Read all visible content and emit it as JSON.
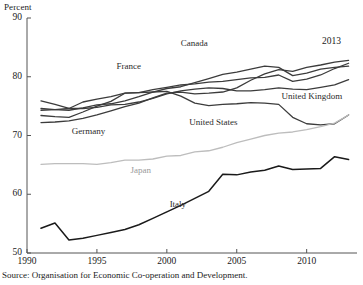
{
  "chart_data": {
    "type": "line",
    "title": "",
    "ylabel": "Percent",
    "xlabel": "",
    "ylim": [
      50,
      90
    ],
    "xlim": [
      1990,
      2013.6
    ],
    "yticks": [
      50,
      60,
      70,
      80,
      90
    ],
    "xticks": [
      1990,
      1995,
      2000,
      2005,
      2010
    ],
    "grid": false,
    "legend_position": "inline-labels",
    "annotations": [
      {
        "text": "2013",
        "x": 2012.2,
        "y": 87.2
      }
    ],
    "x": [
      1991,
      1992,
      1993,
      1994,
      1995,
      1996,
      1997,
      1998,
      1999,
      2000,
      2001,
      2002,
      2003,
      2004,
      2005,
      2006,
      2007,
      2008,
      2009,
      2010,
      2011,
      2012,
      2013
    ],
    "series": [
      {
        "name": "Canada",
        "color": "#3c3c3c",
        "label_x": 2001.0,
        "label_y": 85.6,
        "values": [
          74.6,
          74.4,
          74.3,
          74.7,
          75.2,
          75.4,
          75.9,
          76.6,
          77.4,
          78.0,
          78.3,
          79.0,
          79.7,
          80.4,
          80.8,
          81.3,
          81.8,
          81.6,
          80.2,
          80.6,
          81.3,
          81.6,
          81.8
        ]
      },
      {
        "name": "France",
        "color": "#3c3c3c",
        "label_x": 1996.4,
        "label_y": 81.7,
        "values": [
          75.9,
          75.3,
          74.6,
          74.6,
          74.8,
          75.2,
          75.3,
          75.7,
          76.3,
          77.1,
          77.6,
          77.9,
          78.1,
          78.0,
          77.6,
          77.6,
          77.8,
          78.1,
          77.9,
          77.8,
          78.2,
          78.6,
          79.5
        ]
      },
      {
        "name": "Germany",
        "color": "#3c3c3c",
        "label_x": 1993.2,
        "label_y": 70.6,
        "values": [
          72.2,
          72.3,
          72.5,
          72.9,
          73.5,
          74.2,
          74.9,
          75.5,
          76.4,
          77.2,
          77.4,
          77.1,
          77.2,
          77.4,
          78.1,
          79.4,
          80.5,
          81.2,
          80.9,
          81.6,
          82.0,
          82.5,
          82.8
        ]
      },
      {
        "name": "United Kingdom",
        "color": "#3c3c3c",
        "label_x": 2008.2,
        "label_y": 76.6,
        "values": [
          73.4,
          73.2,
          73.1,
          74.0,
          75.0,
          75.8,
          77.2,
          77.3,
          77.8,
          78.2,
          78.6,
          78.8,
          79.1,
          79.2,
          79.5,
          79.8,
          79.9,
          80.3,
          79.2,
          79.6,
          80.3,
          81.4,
          82.3
        ]
      },
      {
        "name": "United States",
        "color": "#3c3c3c",
        "label_x": 2001.6,
        "label_y": 72.1,
        "values": [
          74.3,
          74.4,
          74.6,
          75.7,
          76.2,
          76.6,
          77.2,
          77.3,
          77.4,
          77.5,
          76.7,
          75.5,
          75.1,
          75.3,
          75.4,
          75.6,
          75.5,
          75.3,
          73.1,
          72.0,
          71.8,
          72.0,
          73.5
        ]
      },
      {
        "name": "Japan",
        "color": "#bdbdbd",
        "label_x": 1997.4,
        "label_y": 63.9,
        "values": [
          65.1,
          65.2,
          65.2,
          65.2,
          65.1,
          65.4,
          65.8,
          65.8,
          66.0,
          66.5,
          66.6,
          67.2,
          67.4,
          68.0,
          68.8,
          69.4,
          70.0,
          70.4,
          70.6,
          71.0,
          71.5,
          72.1,
          73.5
        ]
      },
      {
        "name": "Italy",
        "color": "#1a1a1a",
        "label_x": 2000.2,
        "label_y": 58.1,
        "values": [
          54.2,
          55.1,
          52.2,
          52.5,
          53.0,
          53.5,
          54.0,
          54.8,
          55.9,
          57.0,
          58.1,
          59.3,
          60.5,
          63.4,
          63.3,
          63.8,
          64.1,
          64.8,
          64.2,
          64.3,
          64.4,
          66.4,
          65.9
        ]
      }
    ]
  },
  "source": {
    "text": "Source: Organisation for Economic Co-operation and Development."
  }
}
